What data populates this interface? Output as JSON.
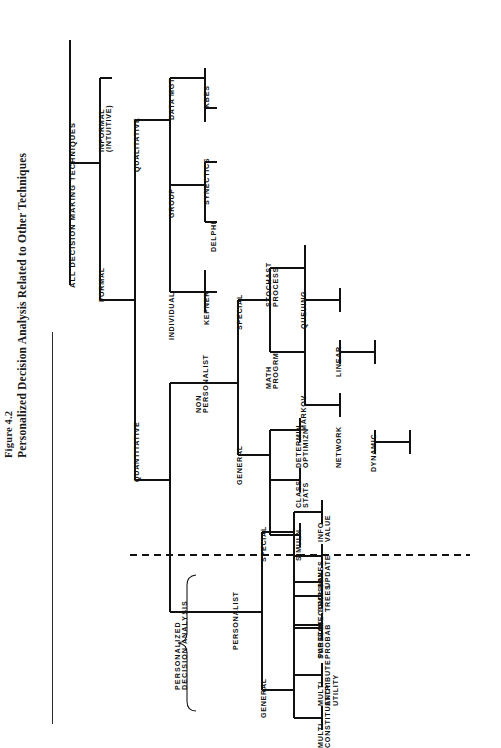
{
  "figure": {
    "number": "Figure 4.2",
    "title": "Personalized Decision Analysis Related to Other Techniques"
  },
  "diagram": {
    "type": "hierarchical-tree",
    "orientation": "rotated-90-ccw",
    "root": "ALL DECISION MAKING TECHNIQUES",
    "annotation": "PERSONALIZED\nDECISION ANALYSIS",
    "divider": "dashed-separator",
    "nodes": {
      "root": "ALL DECISION MAKING TECHNIQUES",
      "formal": "FORMAL",
      "informal": "INFORMAL\n(INTUITIVE)",
      "qualitative": "QUALITATIVE",
      "quantitative": "QUANTITATIVE",
      "data_mgt": "DATA MGT",
      "group": "GROUP",
      "individual": "INDIVIDUAL",
      "kbes": "KBES",
      "synectics": "SYNECTICS",
      "delphi": "DELPHI",
      "kepner": "KEPNER",
      "non_personalist": "NON\nPERSONALIST",
      "personalist": "PERSONALIST",
      "np_special": "SPECIAL",
      "np_general": "GENERAL",
      "stochast_process": "STOCHAST\nPROCESS",
      "math_progrm": "MATH\nPROGRM",
      "queuing": "QUEUING",
      "markov": "MARKOV",
      "linear": "LINEAR",
      "network": "NETWORK",
      "dynamic": "DYNAMIC",
      "determin_optimizn": "DETERMIN\nOPTIMIZN",
      "class_stats": "CLASS\nSTATS",
      "simuln": "SIMULN",
      "p_special": "SPECIAL",
      "p_general": "GENERAL",
      "info_value": "INFO\nVALUE",
      "bayes_update": "BAYES\nUPDATE",
      "decomp": "DECOMP",
      "pareto": "PARETO",
      "decision_trees": "DECISION\nTREES",
      "subject_probab": "SUBJECT\nPROBAB",
      "multi_attribute_utility": "MULTI\nATTRIBUTE\nUTILITY",
      "multi_constituency": "MULTI\nCONSTITUENCY"
    }
  }
}
